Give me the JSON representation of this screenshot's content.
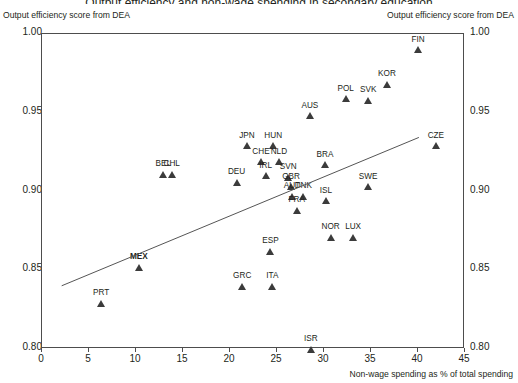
{
  "header": {
    "title_partial": "Output efficiency and non-wage spending in secondary education",
    "y_axis_caption_left": "Output efficiency score from DEA",
    "y_axis_caption_right": "Output efficiency score from DEA"
  },
  "axes": {
    "x_title": "Non-wage spending as % of total spending",
    "x_ticks": [
      "0",
      "5",
      "10",
      "15",
      "20",
      "25",
      "30",
      "35",
      "40",
      "45"
    ],
    "x_tick_values": [
      0,
      5,
      10,
      15,
      20,
      25,
      30,
      35,
      40,
      45
    ],
    "x_min": 0,
    "x_max": 45,
    "y_ticks": [
      "0.80",
      "0.85",
      "0.90",
      "0.95",
      "1.00"
    ],
    "y_tick_values": [
      0.8,
      0.85,
      0.9,
      0.95,
      1.0
    ],
    "y_min": 0.8,
    "y_max": 1.0,
    "grid": false
  },
  "chart_data": {
    "type": "scatter",
    "title": "Output efficiency and non-wage spending in secondary education",
    "xlabel": "Non-wage spending as % of total spending",
    "ylabel": "Output efficiency score from DEA",
    "xlim": [
      0,
      45
    ],
    "ylim": [
      0.8,
      1.0
    ],
    "grid": false,
    "legend": null,
    "marker": "triangle",
    "marker_color": "#3b3b3b",
    "points": [
      {
        "label": "FIN",
        "x": 40.0,
        "y": 0.99,
        "bold": false
      },
      {
        "label": "KOR",
        "x": 36.7,
        "y": 0.968,
        "bold": false
      },
      {
        "label": "SVK",
        "x": 34.7,
        "y": 0.958,
        "bold": false
      },
      {
        "label": "POL",
        "x": 32.3,
        "y": 0.959,
        "bold": false
      },
      {
        "label": "AUS",
        "x": 28.5,
        "y": 0.948,
        "bold": false
      },
      {
        "label": "CZE",
        "x": 41.9,
        "y": 0.929,
        "bold": false
      },
      {
        "label": "JPN",
        "x": 21.8,
        "y": 0.929,
        "bold": false
      },
      {
        "label": "HUN",
        "x": 24.6,
        "y": 0.929,
        "bold": false
      },
      {
        "label": "CHE",
        "x": 23.3,
        "y": 0.919,
        "bold": false
      },
      {
        "label": "NLD",
        "x": 25.2,
        "y": 0.919,
        "bold": false
      },
      {
        "label": "BRA",
        "x": 30.1,
        "y": 0.917,
        "bold": false
      },
      {
        "label": "BEL",
        "x": 12.9,
        "y": 0.911,
        "bold": false
      },
      {
        "label": "CHL",
        "x": 13.8,
        "y": 0.911,
        "bold": false
      },
      {
        "label": "IRL",
        "x": 23.8,
        "y": 0.91,
        "bold": false
      },
      {
        "label": "SVN",
        "x": 26.2,
        "y": 0.909,
        "bold": false
      },
      {
        "label": "DEU",
        "x": 20.7,
        "y": 0.906,
        "bold": false
      },
      {
        "label": "GBR",
        "x": 26.5,
        "y": 0.903,
        "bold": false
      },
      {
        "label": "SWE",
        "x": 34.7,
        "y": 0.903,
        "bold": false
      },
      {
        "label": "AUT",
        "x": 26.6,
        "y": 0.897,
        "bold": false
      },
      {
        "label": "DNK",
        "x": 27.8,
        "y": 0.897,
        "bold": false
      },
      {
        "label": "ISL",
        "x": 30.2,
        "y": 0.894,
        "bold": false
      },
      {
        "label": "FRA",
        "x": 27.1,
        "y": 0.888,
        "bold": false
      },
      {
        "label": "NOR",
        "x": 30.7,
        "y": 0.871,
        "bold": false
      },
      {
        "label": "LUX",
        "x": 33.1,
        "y": 0.871,
        "bold": false
      },
      {
        "label": "ESP",
        "x": 24.3,
        "y": 0.862,
        "bold": false
      },
      {
        "label": "MEX",
        "x": 10.3,
        "y": 0.852,
        "bold": true
      },
      {
        "label": "GRC",
        "x": 21.3,
        "y": 0.84,
        "bold": false
      },
      {
        "label": "ITA",
        "x": 24.5,
        "y": 0.84,
        "bold": false
      },
      {
        "label": "PRT",
        "x": 6.3,
        "y": 0.829,
        "bold": false
      },
      {
        "label": "ISR",
        "x": 28.6,
        "y": 0.8,
        "bold": false
      }
    ],
    "trendline": {
      "x0": 2.2,
      "y0": 0.8395,
      "x1": 40.2,
      "y1": 0.9337,
      "color": "#555555"
    }
  }
}
